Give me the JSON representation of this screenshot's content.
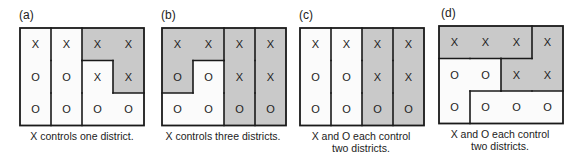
{
  "colors": {
    "shaded": "#c9c9c9",
    "unshaded": "#fbfbfb",
    "border": "#1a1a1a",
    "cell_text": "#222222"
  },
  "grid": {
    "rows": 3,
    "cols": 4,
    "cells": [
      [
        "X",
        "X",
        "X",
        "X"
      ],
      [
        "O",
        "O",
        "X",
        "X"
      ],
      [
        "O",
        "O",
        "O",
        "O"
      ]
    ]
  },
  "panels": [
    {
      "label": "(a)",
      "caption_line1": "X controls one district.",
      "caption_line2": "",
      "districts": [
        {
          "winner": "O",
          "shaded": false,
          "cells": [
            [
              0,
              0
            ],
            [
              1,
              0
            ],
            [
              2,
              0
            ]
          ]
        },
        {
          "winner": "O",
          "shaded": false,
          "cells": [
            [
              0,
              1
            ],
            [
              1,
              1
            ],
            [
              2,
              1
            ]
          ]
        },
        {
          "winner": "X",
          "shaded": true,
          "cells": [
            [
              0,
              2
            ],
            [
              0,
              3
            ],
            [
              1,
              3
            ]
          ]
        },
        {
          "winner": "O",
          "shaded": false,
          "cells": [
            [
              1,
              2
            ],
            [
              2,
              2
            ],
            [
              2,
              3
            ]
          ]
        }
      ]
    },
    {
      "label": "(b)",
      "caption_line1": "X controls three districts.",
      "caption_line2": "",
      "districts": [
        {
          "winner": "X",
          "shaded": true,
          "cells": [
            [
              0,
              0
            ],
            [
              0,
              1
            ],
            [
              1,
              0
            ]
          ]
        },
        {
          "winner": "O",
          "shaded": false,
          "cells": [
            [
              1,
              1
            ],
            [
              2,
              0
            ],
            [
              2,
              1
            ]
          ]
        },
        {
          "winner": "X",
          "shaded": true,
          "cells": [
            [
              0,
              2
            ],
            [
              1,
              2
            ],
            [
              2,
              2
            ]
          ]
        },
        {
          "winner": "X",
          "shaded": true,
          "cells": [
            [
              0,
              3
            ],
            [
              1,
              3
            ],
            [
              2,
              3
            ]
          ]
        }
      ]
    },
    {
      "label": "(c)",
      "caption_line1": "X and O each control",
      "caption_line2": "two districts.",
      "districts": [
        {
          "winner": "O",
          "shaded": false,
          "cells": [
            [
              0,
              0
            ],
            [
              1,
              0
            ],
            [
              2,
              0
            ]
          ]
        },
        {
          "winner": "O",
          "shaded": false,
          "cells": [
            [
              0,
              1
            ],
            [
              1,
              1
            ],
            [
              2,
              1
            ]
          ]
        },
        {
          "winner": "X",
          "shaded": true,
          "cells": [
            [
              0,
              2
            ],
            [
              1,
              2
            ],
            [
              2,
              2
            ]
          ]
        },
        {
          "winner": "X",
          "shaded": true,
          "cells": [
            [
              0,
              3
            ],
            [
              1,
              3
            ],
            [
              2,
              3
            ]
          ]
        }
      ]
    },
    {
      "label": "(d)",
      "caption_line1": "X and O each control",
      "caption_line2": "two districts.",
      "districts": [
        {
          "winner": "X",
          "shaded": true,
          "cells": [
            [
              0,
              0
            ],
            [
              0,
              1
            ],
            [
              0,
              2
            ]
          ]
        },
        {
          "winner": "O",
          "shaded": false,
          "cells": [
            [
              1,
              0
            ],
            [
              1,
              1
            ],
            [
              2,
              0
            ]
          ]
        },
        {
          "winner": "X",
          "shaded": true,
          "cells": [
            [
              0,
              3
            ],
            [
              1,
              2
            ],
            [
              1,
              3
            ]
          ]
        },
        {
          "winner": "O",
          "shaded": false,
          "cells": [
            [
              2,
              1
            ],
            [
              2,
              2
            ],
            [
              2,
              3
            ]
          ]
        }
      ]
    }
  ]
}
